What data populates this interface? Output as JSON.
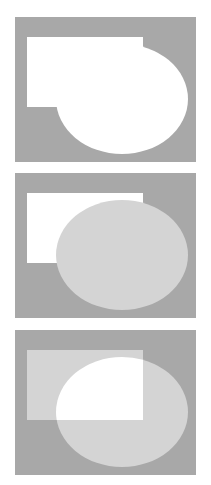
{
  "figure": {
    "panel_count": 3,
    "canvas_width": 211,
    "canvas_height": 485,
    "page_background": "#ffffff"
  },
  "colors": {
    "page_background": "#ffffff",
    "canvas_background": "#a8a8a8",
    "highlight_fill": "#ffffff",
    "shape_fill": "#d4d4d4",
    "outline": "#bdbdbd"
  },
  "geometry": {
    "panel_width": 181,
    "panel_height": 145,
    "rectangle": {
      "x": 12,
      "y": 20,
      "width": 116,
      "height": 70
    },
    "ellipse": {
      "cx": 107,
      "cy": 82,
      "rx": 66,
      "ry": 55
    }
  },
  "panels": [
    {
      "id": "panel-union",
      "label": "Union",
      "operation": "rectangle OR ellipse",
      "highlighted_region": "union",
      "rectangle_fill": "#ffffff",
      "ellipse_fill": "#ffffff",
      "top": 17
    },
    {
      "id": "panel-difference",
      "label": "Difference",
      "operation": "rectangle AND NOT ellipse",
      "highlighted_region": "rectangle-minus-ellipse",
      "rectangle_fill": "#ffffff",
      "ellipse_fill": "#d4d4d4",
      "top": 173
    },
    {
      "id": "panel-intersection",
      "label": "Intersection",
      "operation": "rectangle AND ellipse",
      "highlighted_region": "overlap",
      "rectangle_fill": "#d4d4d4",
      "ellipse_fill": "#d4d4d4",
      "top": 330
    }
  ],
  "chart_data": {
    "type": "diagram",
    "subtitle": "",
    "xlabel": "",
    "ylabel": "",
    "legend_position": "none",
    "grid": false,
    "shapes": [
      {
        "name": "rectangle",
        "kind": "rect",
        "x": 12,
        "y": 20,
        "width": 116,
        "height": 70
      },
      {
        "name": "ellipse",
        "kind": "ellipse",
        "cx": 107,
        "cy": 82,
        "rx": 66,
        "ry": 55
      }
    ],
    "series": [
      {
        "name": "Union",
        "values": [
          "rectangle",
          "ellipse"
        ],
        "result": "white-filled union of both shapes"
      },
      {
        "name": "Difference",
        "values": [
          "rectangle",
          "ellipse"
        ],
        "result": "white rectangle portion outside ellipse, gray ellipse"
      },
      {
        "name": "Intersection",
        "values": [
          "rectangle",
          "ellipse"
        ],
        "result": "white overlap region, both shapes gray"
      }
    ]
  }
}
